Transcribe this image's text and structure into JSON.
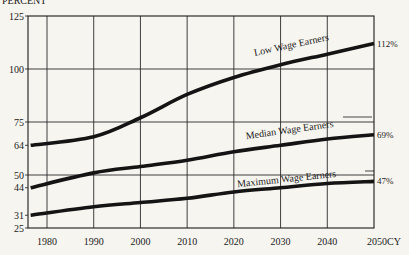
{
  "chart_data": {
    "type": "line",
    "title": "",
    "ylabel": "PERCENT",
    "xlabel": "CY",
    "x": [
      1978,
      1990,
      2000,
      2010,
      2020,
      2030,
      2040,
      2050
    ],
    "x_tick_labels": [
      "1980",
      "1990",
      "2000",
      "2010",
      "2020",
      "2030",
      "2040",
      "2050CY"
    ],
    "y_tick_labels": [
      "125",
      "100",
      "75",
      "64",
      "50",
      "44",
      "31",
      "25"
    ],
    "y_ticks": [
      125,
      100,
      75,
      64,
      50,
      44,
      31,
      25
    ],
    "ylim": [
      25,
      125
    ],
    "xlim": [
      1975,
      2050
    ],
    "grid": true,
    "legend_position": "inline labels on lines",
    "series": [
      {
        "name": "Low Wage Earners",
        "values": [
          64,
          68,
          77,
          88,
          96,
          102,
          107,
          112
        ],
        "end_label": "112%"
      },
      {
        "name": "Median Wage Earners",
        "values": [
          44,
          51,
          54,
          57,
          61,
          64,
          67,
          69
        ],
        "end_label": "69%"
      },
      {
        "name": "Maximum Wage Earners",
        "values": [
          31,
          35,
          37,
          39,
          42,
          44,
          46,
          47
        ],
        "end_label": "47%"
      }
    ]
  }
}
